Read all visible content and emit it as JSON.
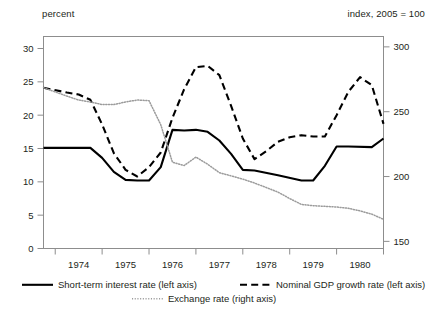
{
  "chart_data": {
    "type": "line",
    "title": "",
    "subtitle": "",
    "left_axis_caption": "percent",
    "right_axis_caption": "index, 2005 = 100",
    "xlabel": "",
    "ylabel": "",
    "grid": false,
    "legend_position": "bottom",
    "x_tick_labels": [
      "1974",
      "1975",
      "1976",
      "1977",
      "1978",
      "1979",
      "1980"
    ],
    "left_tick_labels": [
      "0",
      "5",
      "10",
      "15",
      "20",
      "25",
      "30"
    ],
    "left_tick_values": [
      0,
      5,
      10,
      15,
      20,
      25,
      30
    ],
    "right_tick_labels": [
      "150",
      "200",
      "250",
      "300"
    ],
    "right_tick_values": [
      150,
      200,
      250,
      300
    ],
    "ylim_left": [
      0,
      31.8
    ],
    "ylim_right": [
      144.5,
      308.0
    ],
    "xlim": [
      1973.5,
      1980.75
    ],
    "series": [
      {
        "name": "Short-term interest  rate (left axis)",
        "axis": "left",
        "style": "solid",
        "color": "#000000",
        "x": [
          1973.5,
          1974.0,
          1974.25,
          1974.5,
          1974.75,
          1975.0,
          1975.25,
          1975.5,
          1975.75,
          1976.0,
          1976.25,
          1976.5,
          1976.75,
          1977.0,
          1977.25,
          1977.5,
          1977.75,
          1978.0,
          1978.5,
          1979.0,
          1979.25,
          1979.5,
          1979.75,
          1980.0,
          1980.5,
          1980.75
        ],
        "values": [
          15.1,
          15.1,
          15.1,
          15.1,
          13.6,
          11.5,
          10.3,
          10.2,
          10.2,
          12.2,
          17.8,
          17.7,
          17.8,
          17.5,
          16.2,
          14.2,
          11.8,
          11.7,
          11.0,
          10.2,
          10.2,
          12.4,
          15.3,
          15.3,
          15.2,
          16.5
        ]
      },
      {
        "name": "Nominal GDP growth rate  (left axis)",
        "axis": "left",
        "style": "dashed",
        "color": "#000000",
        "x": [
          1973.5,
          1974.0,
          1974.25,
          1974.5,
          1974.75,
          1975.0,
          1975.25,
          1975.5,
          1975.75,
          1976.0,
          1976.25,
          1976.5,
          1976.75,
          1977.0,
          1977.25,
          1977.5,
          1977.75,
          1978.0,
          1978.25,
          1978.5,
          1978.75,
          1979.0,
          1979.25,
          1979.5,
          1979.75,
          1980.0,
          1980.25,
          1980.5,
          1980.75
        ],
        "values": [
          24.1,
          23.4,
          23.1,
          22.3,
          18.6,
          14.3,
          11.8,
          10.8,
          12.2,
          14.4,
          19.6,
          23.9,
          27.2,
          27.4,
          26.0,
          21.4,
          16.5,
          13.4,
          14.6,
          16.0,
          16.7,
          17.0,
          16.8,
          16.8,
          20.0,
          23.5,
          25.7,
          24.5,
          18.7
        ]
      },
      {
        "name": "Exchange rate (right axis)",
        "axis": "right",
        "style": "dotted",
        "color": "#9b9b9b",
        "x": [
          1973.5,
          1974.0,
          1974.25,
          1974.5,
          1974.75,
          1975.0,
          1975.25,
          1975.5,
          1975.75,
          1976.0,
          1976.25,
          1976.5,
          1976.75,
          1977.0,
          1977.25,
          1977.5,
          1977.75,
          1978.0,
          1978.25,
          1978.5,
          1978.75,
          1979.0,
          1979.25,
          1979.5,
          1979.75,
          1980.0,
          1980.25,
          1980.5,
          1980.75
        ],
        "values_right_axis": [
          268.5,
          262.0,
          259.0,
          257.5,
          255.5,
          255.5,
          257.5,
          259.0,
          258.5,
          240.0,
          211.0,
          208.5,
          215.0,
          209.5,
          203.0,
          200.5,
          198.0,
          195.0,
          191.5,
          188.0,
          183.0,
          178.5,
          177.5,
          177.0,
          176.5,
          175.5,
          173.5,
          171.0,
          167.0
        ]
      }
    ]
  },
  "legend": {
    "items": [
      {
        "label": "Short-term interest  rate (left axis)",
        "style": "solid"
      },
      {
        "label": "Nominal GDP growth rate  (left axis)",
        "style": "dashed"
      },
      {
        "label": "Exchange rate (right axis)",
        "style": "dotted"
      }
    ]
  }
}
